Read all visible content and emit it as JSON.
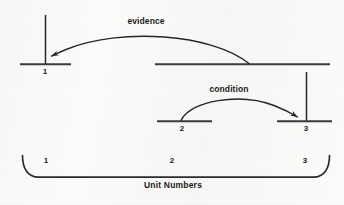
{
  "diagram": {
    "type": "schematic-timeline-diagram",
    "caption": "Unit Numbers",
    "ink_color": "#262626",
    "background_color": "#fbfbfa",
    "arcs": [
      {
        "id": "evidence",
        "label": "evidence",
        "from": "top-right-segment",
        "to": "top-left-segment-tick-1",
        "direction": "right-to-left"
      },
      {
        "id": "condition",
        "label": "condition",
        "from": "middle-left-segment-2",
        "to": "middle-right-segment-3",
        "direction": "left-to-right"
      }
    ],
    "top_row": {
      "left_segment_label": "1",
      "right_segment_label": ""
    },
    "middle_row": {
      "left_segment_label": "2",
      "right_segment_label": "3"
    },
    "brace_labels": [
      "1",
      "2",
      "3"
    ],
    "labels": {
      "evidence": "evidence",
      "condition": "condition",
      "unit_numbers": "Unit Numbers",
      "n1": "1",
      "n2": "2",
      "n3": "3",
      "b1": "1",
      "b2": "2",
      "b3": "3"
    }
  }
}
